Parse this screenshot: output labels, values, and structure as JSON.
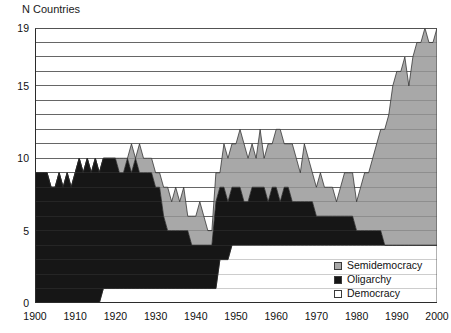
{
  "figure": {
    "y_axis_title": "N Countries"
  },
  "legend": {
    "items": [
      {
        "label": "Semidemocracy",
        "color": "#a8a8a8",
        "swatch_name": "legend-swatch-semidemocracy"
      },
      {
        "label": "Oligarchy",
        "color": "#161616",
        "swatch_name": "legend-swatch-oligarchy"
      },
      {
        "label": "Democracy",
        "color": "#ffffff",
        "swatch_name": "legend-swatch-democracy"
      }
    ]
  },
  "chart_data": {
    "type": "area",
    "stacked": true,
    "title": "",
    "subtitle": "",
    "xlabel": "",
    "ylabel": "N Countries",
    "xlim": [
      1900,
      2000
    ],
    "ylim": [
      0,
      19
    ],
    "grid": true,
    "grid_axis": "y",
    "gridline_values": [
      1,
      2,
      3,
      4,
      5,
      6,
      7,
      8,
      9,
      10,
      11,
      12,
      13,
      14,
      15,
      16,
      17,
      18,
      19
    ],
    "ytick_labels": [
      "0",
      "5",
      "10",
      "15",
      "19"
    ],
    "ytick_values": [
      0,
      5,
      10,
      15,
      19
    ],
    "xtick_labels": [
      "1900",
      "1910",
      "1920",
      "1930",
      "1940",
      "1950",
      "1960",
      "1970",
      "1980",
      "1990",
      "2000"
    ],
    "xtick_values": [
      1900,
      1910,
      1920,
      1930,
      1940,
      1950,
      1960,
      1970,
      1980,
      1990,
      2000
    ],
    "xtick_minor_step": 1,
    "legend_position": "lower-right",
    "stack_order_bottom_to_top": [
      "Democracy",
      "Oligarchy",
      "Semidemocracy"
    ],
    "x": [
      1900,
      1901,
      1902,
      1903,
      1904,
      1905,
      1906,
      1907,
      1908,
      1909,
      1910,
      1911,
      1912,
      1913,
      1914,
      1915,
      1916,
      1917,
      1918,
      1919,
      1920,
      1921,
      1922,
      1923,
      1924,
      1925,
      1926,
      1927,
      1928,
      1929,
      1930,
      1931,
      1932,
      1933,
      1934,
      1935,
      1936,
      1937,
      1938,
      1939,
      1940,
      1941,
      1942,
      1943,
      1944,
      1945,
      1946,
      1947,
      1948,
      1949,
      1950,
      1951,
      1952,
      1953,
      1954,
      1955,
      1956,
      1957,
      1958,
      1959,
      1960,
      1961,
      1962,
      1963,
      1964,
      1965,
      1966,
      1967,
      1968,
      1969,
      1970,
      1971,
      1972,
      1973,
      1974,
      1975,
      1976,
      1977,
      1978,
      1979,
      1980,
      1981,
      1982,
      1983,
      1984,
      1985,
      1986,
      1987,
      1988,
      1989,
      1990,
      1991,
      1992,
      1993,
      1994,
      1995,
      1996,
      1997,
      1998,
      1999,
      2000
    ],
    "series": [
      {
        "name": "Democracy",
        "color": "#ffffff",
        "values": [
          0,
          0,
          0,
          0,
          0,
          0,
          0,
          0,
          0,
          0,
          0,
          0,
          0,
          0,
          0,
          0,
          0,
          1,
          1,
          1,
          1,
          1,
          1,
          1,
          1,
          1,
          1,
          1,
          1,
          1,
          1,
          1,
          1,
          1,
          1,
          1,
          1,
          1,
          1,
          1,
          1,
          1,
          1,
          1,
          1,
          1,
          3,
          3,
          3,
          4,
          4,
          4,
          4,
          4,
          4,
          4,
          4,
          4,
          4,
          4,
          4,
          4,
          4,
          4,
          4,
          4,
          4,
          4,
          4,
          4,
          4,
          4,
          4,
          4,
          4,
          4,
          4,
          4,
          4,
          4,
          4,
          4,
          4,
          4,
          4,
          4,
          4,
          4,
          4,
          4,
          4,
          4,
          4,
          4,
          4,
          4,
          4,
          4,
          4,
          4,
          4
        ]
      },
      {
        "name": "Oligarchy",
        "color": "#161616",
        "values": [
          9,
          9,
          9,
          9,
          8,
          8,
          9,
          8,
          9,
          8,
          9,
          10,
          9,
          10,
          9,
          10,
          9,
          9,
          9,
          9,
          9,
          8,
          8,
          9,
          8,
          9,
          8,
          8,
          8,
          8,
          7,
          7,
          5,
          4,
          4,
          4,
          4,
          4,
          4,
          3,
          3,
          3,
          3,
          3,
          3,
          6,
          5,
          5,
          4,
          4,
          4,
          4,
          3,
          3,
          4,
          4,
          4,
          4,
          3,
          4,
          4,
          3,
          4,
          4,
          3,
          3,
          3,
          3,
          3,
          3,
          2,
          2,
          2,
          2,
          2,
          2,
          2,
          2,
          2,
          2,
          1,
          1,
          1,
          1,
          1,
          1,
          1,
          0,
          0,
          0,
          0,
          0,
          0,
          0,
          0,
          0,
          0,
          0,
          0,
          0,
          0
        ]
      },
      {
        "name": "Semidemocracy",
        "color": "#a8a8a8",
        "values": [
          0,
          0,
          0,
          0,
          0,
          0,
          0,
          0,
          0,
          0,
          0,
          0,
          0,
          0,
          0,
          0,
          0,
          0,
          0,
          0,
          0,
          1,
          1,
          0,
          2,
          0,
          2,
          1,
          1,
          1,
          1,
          1,
          2,
          3,
          2,
          3,
          2,
          3,
          1,
          2,
          2,
          3,
          2,
          1,
          1,
          2,
          1,
          3,
          3,
          3,
          3,
          4,
          4,
          3,
          3,
          2,
          4,
          2,
          4,
          3,
          4,
          5,
          3,
          3,
          4,
          3,
          2,
          4,
          3,
          2,
          2,
          3,
          2,
          2,
          2,
          1,
          2,
          3,
          3,
          3,
          2,
          3,
          4,
          4,
          5,
          6,
          7,
          8,
          9,
          11,
          12,
          12,
          13,
          11,
          13,
          14,
          14,
          15,
          14,
          14,
          15
        ]
      }
    ]
  }
}
